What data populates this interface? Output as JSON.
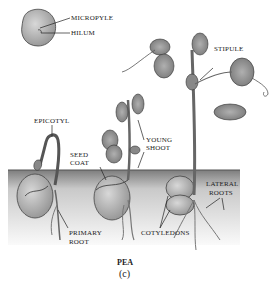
{
  "figure": {
    "title": "PEA",
    "panel": "(c)",
    "colors": {
      "soil_top": "#8a8a8a",
      "soil_bottom": "#f4f4f4",
      "ink": "#222222",
      "leaf": "#9a9a9a",
      "seed": "#b5b5b5"
    }
  },
  "labels": {
    "micropyle": "MICROPYLE",
    "hilum": "HILUM",
    "stipule": "STIPULE",
    "epicotyl": "EPICOTYL",
    "seed_coat_1": "SEED",
    "seed_coat_2": "COAT",
    "young_shoot_1": "YOUNG",
    "young_shoot_2": "SHOOT",
    "lateral_roots_1": "LATERAL",
    "lateral_roots_2": "ROOTS",
    "primary_root_1": "PRIMARY",
    "primary_root_2": "ROOT",
    "cotyledons": "COTYLEDONS"
  }
}
